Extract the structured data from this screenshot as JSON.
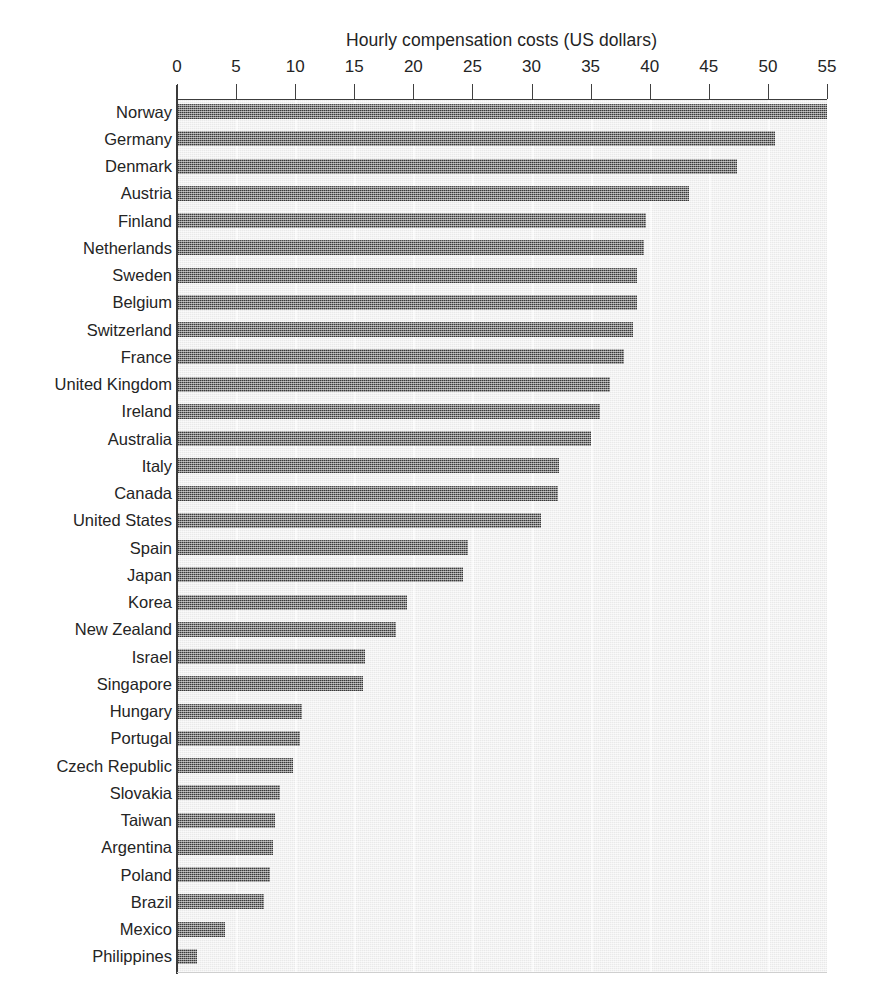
{
  "chart_data": {
    "type": "bar",
    "orientation": "horizontal",
    "title": "Hourly compensation costs (US dollars)",
    "xlabel": "Hourly compensation costs (US dollars)",
    "ylabel": "",
    "xlim": [
      0,
      55
    ],
    "ylim": null,
    "grid": true,
    "grid_axis": "x",
    "legend": false,
    "legend_position": "none",
    "xticks": [
      0,
      5,
      10,
      15,
      20,
      25,
      30,
      35,
      40,
      45,
      50,
      55
    ],
    "xtick_labels": [
      "0",
      "5",
      "10",
      "15",
      "20",
      "25",
      "30",
      "35",
      "40",
      "45",
      "50",
      "55"
    ],
    "categories": [
      "Norway",
      "Germany",
      "Denmark",
      "Austria",
      "Finland",
      "Netherlands",
      "Sweden",
      "Belgium",
      "Switzerland",
      "France",
      "United Kingdom",
      "Ireland",
      "Australia",
      "Italy",
      "Canada",
      "United States",
      "Spain",
      "Japan",
      "Korea",
      "New Zealand",
      "Israel",
      "Singapore",
      "Hungary",
      "Portugal",
      "Czech Republic",
      "Slovakia",
      "Taiwan",
      "Argentina",
      "Poland",
      "Brazil",
      "Mexico",
      "Philippines"
    ],
    "values": [
      55.0,
      50.6,
      47.4,
      43.3,
      39.7,
      39.5,
      38.9,
      38.9,
      38.6,
      37.8,
      36.6,
      35.8,
      35.0,
      32.3,
      32.2,
      30.8,
      24.6,
      24.2,
      19.5,
      18.5,
      15.9,
      15.7,
      10.6,
      10.4,
      9.8,
      8.7,
      8.3,
      8.1,
      7.9,
      7.4,
      4.1,
      1.7
    ],
    "bar_color": "#3b3b3b",
    "plot_background": "#efefef",
    "gridline_color": "#fcfcfc",
    "axis_color": "#3a3a3a",
    "text_color": "#242424"
  }
}
